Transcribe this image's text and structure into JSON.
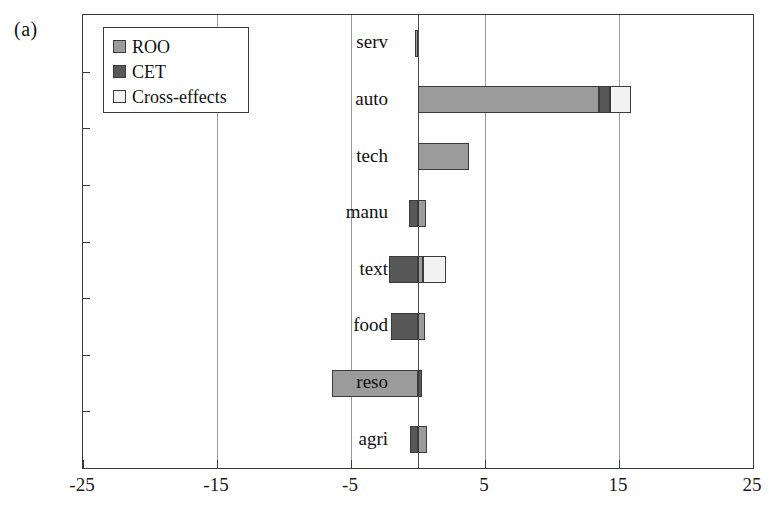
{
  "figure": {
    "panel_label": "(a)"
  },
  "legend": {
    "position": "top-left-inside",
    "items": [
      {
        "label": "ROO",
        "color": "#9b9b9b",
        "swatch_name": "legend-swatch-roo"
      },
      {
        "label": "CET",
        "color": "#585858",
        "swatch_name": "legend-swatch-cet"
      },
      {
        "label": "Cross-effects",
        "color": "#f2f2f2",
        "swatch_name": "legend-swatch-cross-effects"
      }
    ]
  },
  "chart_data": {
    "type": "bar",
    "orientation": "horizontal",
    "stacked": true,
    "title": "",
    "xlabel": "",
    "ylabel": "",
    "xlim": [
      -25,
      25
    ],
    "xticks": [
      -25,
      -15,
      -5,
      5,
      15,
      25
    ],
    "xtick_labels": [
      "-25",
      "-15",
      "-5",
      "5",
      "15",
      "25"
    ],
    "grid": true,
    "grid_axis": "x",
    "zero_line": 0,
    "categories": [
      "serv",
      "auto",
      "tech",
      "manu",
      "text",
      "food",
      "reso",
      "agri"
    ],
    "series": [
      {
        "name": "ROO",
        "color": "#9b9b9b",
        "values": [
          -0.2,
          13.5,
          3.8,
          0.6,
          0.4,
          0.5,
          -6.4,
          0.7
        ]
      },
      {
        "name": "CET",
        "color": "#585858",
        "values": [
          0.0,
          0.8,
          0.0,
          -0.7,
          -2.2,
          -2.0,
          0.3,
          -0.6
        ]
      },
      {
        "name": "Cross-effects",
        "color": "#f2f2f2",
        "values": [
          0.0,
          1.6,
          0.0,
          0.0,
          1.7,
          0.0,
          0.0,
          0.0
        ]
      }
    ]
  }
}
